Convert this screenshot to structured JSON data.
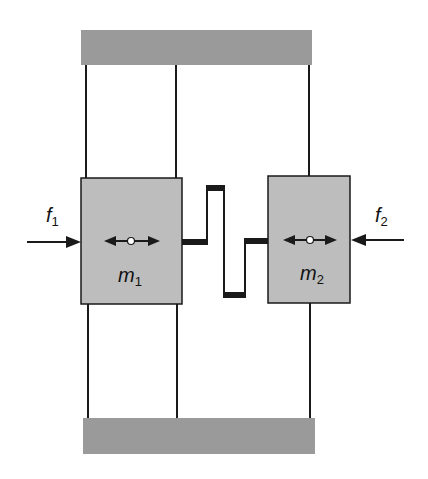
{
  "diagram": {
    "masses": [
      {
        "id": "m1",
        "label": "m",
        "subscript": "1"
      },
      {
        "id": "m2",
        "label": "m",
        "subscript": "2"
      }
    ],
    "forces": [
      {
        "id": "f1",
        "label": "f",
        "subscript": "1",
        "direction": "right"
      },
      {
        "id": "f2",
        "label": "f",
        "subscript": "2",
        "direction": "left"
      }
    ],
    "colors": {
      "wall": "#999999",
      "mass": "#bbbbbb",
      "line": "#1a1a1a"
    }
  }
}
